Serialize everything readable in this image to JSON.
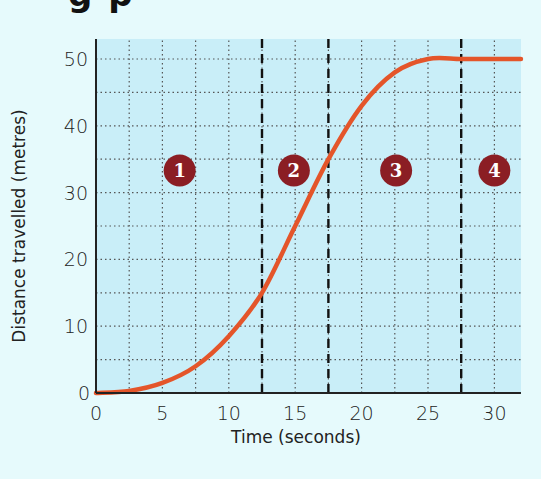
{
  "heading_fragment": "g p",
  "chart_data": {
    "type": "line",
    "title": "",
    "xlabel": "Time (seconds)",
    "ylabel": "Distance travelled (metres)",
    "xlim": [
      0,
      32
    ],
    "ylim": [
      0,
      53
    ],
    "x_ticks": [
      "0",
      "5",
      "10",
      "15",
      "20",
      "25",
      "30"
    ],
    "y_ticks": [
      "0",
      "10",
      "20",
      "30",
      "40",
      "50"
    ],
    "grid": {
      "on": true,
      "style": "dotted",
      "x_step": 2.5,
      "y_step": 5
    },
    "series": [
      {
        "name": "Distance-time curve",
        "color": "#e4552a",
        "x": [
          0,
          2.5,
          5,
          7.5,
          10,
          12.5,
          15,
          17.5,
          20,
          22.5,
          25,
          27.5,
          30,
          32
        ],
        "y": [
          0,
          0.3,
          1.5,
          4,
          8.5,
          15,
          25,
          35,
          43,
          48,
          50,
          50,
          50,
          50
        ]
      }
    ],
    "region_dividers": {
      "x": [
        12.5,
        17.5,
        27.5
      ],
      "style": "dashed",
      "color": "#111111"
    },
    "annotations": [
      {
        "label": "1",
        "x": 6.3,
        "y": 33.3,
        "color": "#8b1e24"
      },
      {
        "label": "2",
        "x": 14.9,
        "y": 33.3,
        "color": "#8b1e24"
      },
      {
        "label": "3",
        "x": 22.6,
        "y": 33.3,
        "color": "#8b1e24"
      },
      {
        "label": "4",
        "x": 30,
        "y": 33.3,
        "color": "#8b1e24"
      }
    ],
    "plot_background": "#c9eef8",
    "page_background": "#e6fafc"
  }
}
